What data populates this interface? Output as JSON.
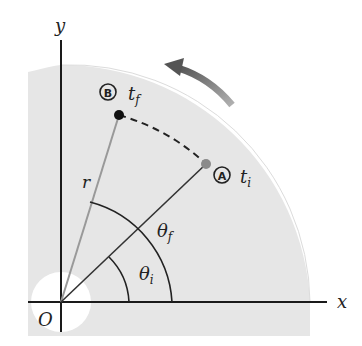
{
  "diagram": {
    "type": "rotational-motion-quarter-disc",
    "colors": {
      "disc": "#e6e6e6",
      "axis": "#1a1a1a",
      "radius_line": "#999999",
      "arrow": "#6e6e6e",
      "point_B": "#111111",
      "point_A": "#8a8a8a"
    },
    "axes": {
      "x_label": "x",
      "y_label": "y",
      "origin_label": "O"
    },
    "points": {
      "B": {
        "marker": "B",
        "time_label": "t",
        "time_subscript": "f"
      },
      "A": {
        "marker": "A",
        "time_label": "t",
        "time_subscript": "i"
      }
    },
    "radius_label": "r",
    "angles": {
      "final": {
        "symbol": "θ",
        "subscript": "f"
      },
      "initial": {
        "symbol": "θ",
        "subscript": "i"
      }
    },
    "rotation_direction": "counterclockwise"
  }
}
